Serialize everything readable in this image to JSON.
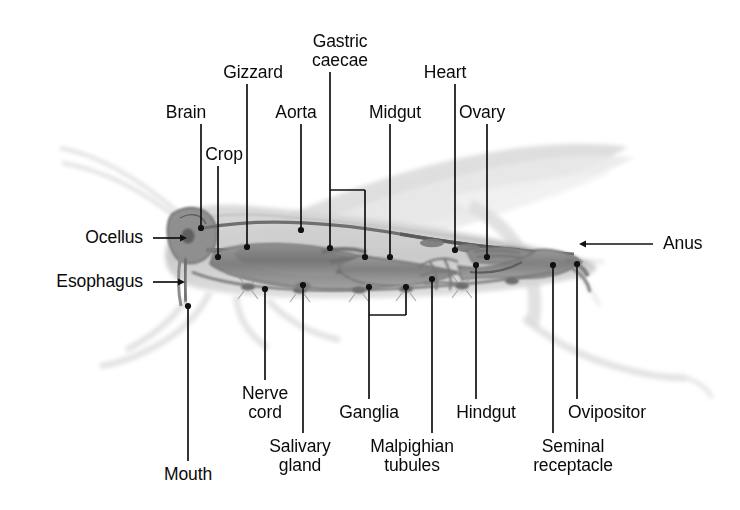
{
  "figure": {
    "organism": "grasshopper",
    "view": "lateral cutaway",
    "colors": {
      "leader_line": "#111111",
      "label_text": "#0a0a0a",
      "background": "#ffffff",
      "body_outline": "#6e6e6e",
      "organ_fill_dark": "#8a8a8a",
      "organ_fill_mid": "#a8a8a8",
      "wing_gray": "#dcdcdc",
      "leg_gray": "#e2e2e2"
    },
    "labels": [
      {
        "id": "brain",
        "text": "Brain",
        "x": 186,
        "y": 103,
        "align": "c",
        "anchor": [
          201,
          228
        ]
      },
      {
        "id": "crop",
        "text": "Crop",
        "x": 224,
        "y": 145,
        "align": "c",
        "anchor": [
          218,
          257
        ]
      },
      {
        "id": "gizzard",
        "text": "Gizzard",
        "x": 253,
        "y": 63,
        "align": "c",
        "anchor": [
          247,
          247
        ]
      },
      {
        "id": "aorta",
        "text": "Aorta",
        "x": 296,
        "y": 103,
        "align": "c",
        "anchor": [
          301,
          230
        ]
      },
      {
        "id": "gastric-caecae",
        "text": "Gastric\ncaecae",
        "x": 340,
        "y": 32,
        "align": "c",
        "anchor": [
          330,
          248
        ]
      },
      {
        "id": "midgut",
        "text": "Midgut",
        "x": 395,
        "y": 103,
        "align": "c",
        "anchor": [
          390,
          257
        ]
      },
      {
        "id": "heart",
        "text": "Heart",
        "x": 445,
        "y": 63,
        "align": "c",
        "anchor": [
          455,
          250
        ]
      },
      {
        "id": "ovary",
        "text": "Ovary",
        "x": 482,
        "y": 103,
        "align": "c",
        "anchor": [
          487,
          257
        ]
      },
      {
        "id": "ocellus",
        "text": "Ocellus",
        "x": 143,
        "y": 228,
        "align": "r",
        "anchor": [
          188,
          237
        ]
      },
      {
        "id": "esophagus",
        "text": "Esophagus",
        "x": 143,
        "y": 272,
        "align": "r",
        "anchor": [
          186,
          280
        ]
      },
      {
        "id": "anus",
        "text": "Anus",
        "x": 663,
        "y": 234,
        "align": "l",
        "anchor": [
          578,
          243
        ]
      },
      {
        "id": "mouth",
        "text": "Mouth",
        "x": 188,
        "y": 465,
        "align": "c",
        "anchor": [
          188,
          306
        ]
      },
      {
        "id": "nerve-cord",
        "text": "Nerve\ncord",
        "x": 265,
        "y": 384,
        "align": "c",
        "anchor": [
          265,
          289
        ]
      },
      {
        "id": "salivary-gland",
        "text": "Salivary\ngland",
        "x": 300,
        "y": 437,
        "align": "c",
        "anchor": [
          303,
          285
        ]
      },
      {
        "id": "ganglia",
        "text": "Ganglia",
        "x": 369,
        "y": 403,
        "align": "c",
        "anchor": [
          359,
          287
        ]
      },
      {
        "id": "malpighian-tubules",
        "text": "Malpighian\ntubules",
        "x": 412,
        "y": 437,
        "align": "c",
        "anchor": [
          432,
          279
        ]
      },
      {
        "id": "hindgut",
        "text": "Hindgut",
        "x": 486,
        "y": 403,
        "align": "c",
        "anchor": [
          476,
          265
        ]
      },
      {
        "id": "seminal-receptacle",
        "text": "Seminal\nreceptacle",
        "x": 573,
        "y": 437,
        "align": "c",
        "anchor": [
          553,
          265
        ]
      },
      {
        "id": "ovipositor",
        "text": "Ovipositor",
        "x": 607,
        "y": 403,
        "align": "c",
        "anchor": [
          577,
          264
        ]
      }
    ],
    "brackets": [
      {
        "id": "gastric-caecae-bracket",
        "left": 330,
        "right": 365,
        "top": 190,
        "left_end": 248,
        "right_end": 257
      },
      {
        "id": "ganglia-bracket",
        "left": 369,
        "right": 406,
        "top": 315,
        "left_end": 287,
        "right_end": 287
      }
    ]
  }
}
